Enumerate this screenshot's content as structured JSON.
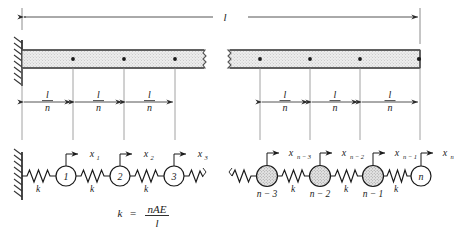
{
  "figure": {
    "name": "bar-discretized-spring-mass-model",
    "total_length_label": "l",
    "segment_label_numerator": "l",
    "segment_label_denominator": "n",
    "stiffness_label": "k",
    "formula": {
      "lhs": "k",
      "equals": "=",
      "numerator": "nAE",
      "denominator": "l"
    },
    "segment_dimensions": [
      {
        "numerator": "l",
        "denominator": "n"
      },
      {
        "numerator": "l",
        "denominator": "n"
      },
      {
        "numerator": "l",
        "denominator": "n"
      },
      {
        "numerator": "l",
        "denominator": "n"
      },
      {
        "numerator": "l",
        "denominator": "n"
      },
      {
        "numerator": "l",
        "denominator": "n"
      }
    ],
    "masses_left": [
      {
        "inside_label": "1",
        "below_label": ""
      },
      {
        "inside_label": "2",
        "below_label": ""
      },
      {
        "inside_label": "3",
        "below_label": ""
      }
    ],
    "masses_right": [
      {
        "inside_label": "",
        "below_label": "n − 3"
      },
      {
        "inside_label": "",
        "below_label": "n − 2"
      },
      {
        "inside_label": "",
        "below_label": "n − 1"
      },
      {
        "inside_label": "n",
        "below_label": ""
      }
    ],
    "displacements_left": [
      "x",
      "x",
      "x"
    ],
    "displacement_subscripts_left": [
      "1",
      "2",
      "3"
    ],
    "displacements_right": [
      "x",
      "x",
      "x",
      "x"
    ],
    "displacement_subscripts_right": [
      "n − 3",
      "n − 2",
      "n − 1",
      "n"
    ],
    "spring_labels_left": [
      "k",
      "k",
      "k"
    ],
    "spring_labels_right": [
      "k",
      "k",
      "k"
    ],
    "colors": {
      "line": "#1a1a1a",
      "bar_fill": "#e8e8e8",
      "bar_stroke": "#555555",
      "mass_fill_shaded": "#dcdcdc",
      "mass_fill_open": "#ffffff",
      "dim_line": "#444444",
      "wall_hatch": "#333333"
    }
  }
}
